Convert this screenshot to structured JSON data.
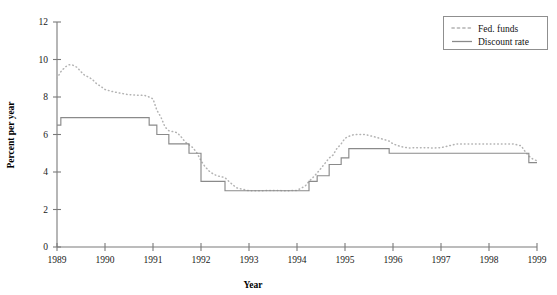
{
  "chart_data": {
    "type": "line",
    "title": "",
    "xlabel": "Year",
    "ylabel": "Percent per year",
    "xlim": [
      1989,
      1999
    ],
    "ylim": [
      0,
      12
    ],
    "ytick_step": 2,
    "grid": false,
    "legend_position": "top-right",
    "xticklabels": [
      "1989",
      "1990",
      "1991",
      "1992",
      "1993",
      "1994",
      "1995",
      "1996",
      "1997",
      "1998",
      "1999"
    ],
    "yticklabels": [
      "0",
      "2",
      "4",
      "6",
      "8",
      "10",
      "12"
    ],
    "series": [
      {
        "name": "Fed. funds",
        "style": "dotted",
        "color": "#b3b3b3",
        "x": [
          1989.0,
          1989.08,
          1989.17,
          1989.25,
          1989.33,
          1989.42,
          1989.5,
          1989.58,
          1989.67,
          1989.75,
          1989.83,
          1989.92,
          1990.0,
          1990.17,
          1990.33,
          1990.5,
          1990.67,
          1990.83,
          1990.92,
          1991.0,
          1991.08,
          1991.17,
          1991.25,
          1991.33,
          1991.42,
          1991.5,
          1991.58,
          1991.67,
          1991.75,
          1991.83,
          1991.92,
          1992.0,
          1992.08,
          1992.17,
          1992.25,
          1992.33,
          1992.42,
          1992.5,
          1992.58,
          1992.67,
          1992.75,
          1992.83,
          1992.92,
          1993.0,
          1993.25,
          1993.5,
          1993.75,
          1994.0,
          1994.17,
          1994.25,
          1994.33,
          1994.42,
          1994.5,
          1994.58,
          1994.67,
          1994.75,
          1994.83,
          1994.92,
          1995.0,
          1995.08,
          1995.17,
          1995.25,
          1995.42,
          1995.58,
          1995.75,
          1995.92,
          1996.0,
          1996.17,
          1996.33,
          1996.5,
          1996.67,
          1996.83,
          1997.0,
          1997.17,
          1997.33,
          1997.5,
          1997.67,
          1997.83,
          1998.0,
          1998.17,
          1998.33,
          1998.5,
          1998.67,
          1998.75,
          1998.83,
          1998.92,
          1999.0
        ],
        "y": [
          9.0,
          9.35,
          9.6,
          9.72,
          9.7,
          9.58,
          9.35,
          9.15,
          9.05,
          8.9,
          8.7,
          8.55,
          8.4,
          8.28,
          8.2,
          8.12,
          8.1,
          8.08,
          8.0,
          7.9,
          7.3,
          6.9,
          6.4,
          6.2,
          6.15,
          6.1,
          5.9,
          5.6,
          5.45,
          5.3,
          5.0,
          4.6,
          4.3,
          4.05,
          3.9,
          3.8,
          3.75,
          3.7,
          3.5,
          3.3,
          3.15,
          3.1,
          3.05,
          3.0,
          3.0,
          3.02,
          3.0,
          3.02,
          3.25,
          3.5,
          3.7,
          3.95,
          4.2,
          4.45,
          4.75,
          4.9,
          5.25,
          5.5,
          5.8,
          5.9,
          5.98,
          6.0,
          6.0,
          5.9,
          5.78,
          5.65,
          5.5,
          5.35,
          5.28,
          5.3,
          5.3,
          5.28,
          5.3,
          5.4,
          5.5,
          5.5,
          5.5,
          5.5,
          5.5,
          5.5,
          5.5,
          5.5,
          5.4,
          5.1,
          4.85,
          4.68,
          4.6
        ]
      },
      {
        "name": "Discount rate",
        "style": "solid",
        "color": "#8a8a8a",
        "note": "step function of official discount rate changes",
        "steps": [
          {
            "from": 1989.0,
            "to": 1989.08,
            "value": 6.5
          },
          {
            "from": 1989.08,
            "to": 1990.92,
            "value": 6.9
          },
          {
            "from": 1990.92,
            "to": 1991.08,
            "value": 6.5
          },
          {
            "from": 1991.08,
            "to": 1991.33,
            "value": 6.0
          },
          {
            "from": 1991.33,
            "to": 1991.75,
            "value": 5.5
          },
          {
            "from": 1991.75,
            "to": 1992.0,
            "value": 5.0
          },
          {
            "from": 1992.0,
            "to": 1992.5,
            "value": 3.5
          },
          {
            "from": 1992.5,
            "to": 1994.25,
            "value": 3.0
          },
          {
            "from": 1994.25,
            "to": 1994.42,
            "value": 3.5
          },
          {
            "from": 1994.42,
            "to": 1994.67,
            "value": 3.8
          },
          {
            "from": 1994.67,
            "to": 1994.92,
            "value": 4.4
          },
          {
            "from": 1994.92,
            "to": 1995.08,
            "value": 4.75
          },
          {
            "from": 1995.08,
            "to": 1995.92,
            "value": 5.25
          },
          {
            "from": 1995.92,
            "to": 1998.83,
            "value": 5.0
          },
          {
            "from": 1998.83,
            "to": 1999.0,
            "value": 4.5
          }
        ]
      }
    ]
  },
  "legend": {
    "items": [
      {
        "label": "Fed. funds",
        "style": "dotted"
      },
      {
        "label": "Discount rate",
        "style": "solid"
      }
    ]
  }
}
